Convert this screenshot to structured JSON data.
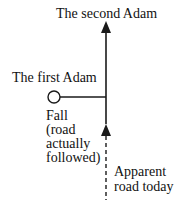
{
  "diagram": {
    "labels": {
      "second_adam": "The second Adam",
      "first_adam": "The first Adam",
      "fall": "Fall\n(road\nactually\nfollowed)",
      "apparent_road": "Apparent\nroad today"
    },
    "colors": {
      "line": "#1a1a1a",
      "background": "#ffffff"
    }
  }
}
